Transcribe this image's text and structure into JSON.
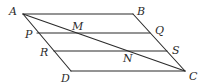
{
  "figure": {
    "type": "geometry-diagram",
    "stroke_color": "#2b2b2b",
    "points": {
      "A": {
        "label": "A",
        "x": 23,
        "y": 14
      },
      "B": {
        "label": "B",
        "x": 133,
        "y": 14
      },
      "C": {
        "label": "C",
        "x": 185,
        "y": 71
      },
      "D": {
        "label": "D",
        "x": 71,
        "y": 71
      },
      "P": {
        "label": "P",
        "x": 37,
        "y": 33
      },
      "Q": {
        "label": "Q",
        "x": 150,
        "y": 33
      },
      "R": {
        "label": "R",
        "x": 54,
        "y": 51
      },
      "S": {
        "label": "S",
        "x": 167,
        "y": 51
      },
      "M": {
        "label": "M",
        "x": 74,
        "y": 33
      },
      "N": {
        "label": "N",
        "x": 128,
        "y": 51
      }
    },
    "segments": [
      {
        "name": "AB",
        "from": "A",
        "to": "B"
      },
      {
        "name": "BC",
        "from": "B",
        "to": "C"
      },
      {
        "name": "CD",
        "from": "C",
        "to": "D"
      },
      {
        "name": "DA",
        "from": "D",
        "to": "A"
      },
      {
        "name": "AC",
        "from": "A",
        "to": "C"
      },
      {
        "name": "PQ",
        "from": "P",
        "to": "Q"
      },
      {
        "name": "RS",
        "from": "R",
        "to": "S"
      }
    ],
    "labels": {
      "A": "A",
      "B": "B",
      "C": "C",
      "D": "D",
      "P": "P",
      "Q": "Q",
      "R": "R",
      "S": "S",
      "M": "M",
      "N": "N"
    }
  }
}
